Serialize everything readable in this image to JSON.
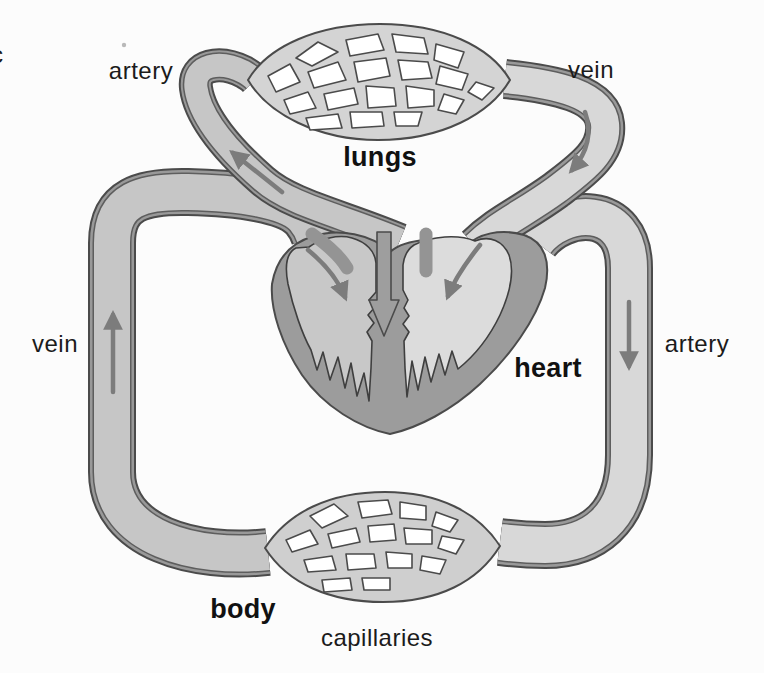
{
  "figure": {
    "panel_letter": "c",
    "labels": {
      "pulmonary_artery": "artery",
      "pulmonary_vein": "vein",
      "lungs": "lungs",
      "systemic_vein": "vein",
      "systemic_artery": "artery",
      "heart": "heart",
      "body": "body",
      "capillaries": "capillaries"
    },
    "arrows": [
      {
        "name": "pulmonary-artery-flow",
        "direction": "up-left toward lungs"
      },
      {
        "name": "pulmonary-vein-flow",
        "direction": "down toward heart"
      },
      {
        "name": "left-chamber-inflow",
        "direction": "down into heart"
      },
      {
        "name": "right-chamber-inflow",
        "direction": "down into heart"
      },
      {
        "name": "septum-flow",
        "direction": "down toward heart apex"
      },
      {
        "name": "systemic-vein-flow",
        "direction": "up toward heart"
      },
      {
        "name": "systemic-artery-flow",
        "direction": "down toward body"
      }
    ],
    "colors": {
      "background": "#fcfcfc",
      "tube_fill_deoxygenated": "#c6c6c6",
      "tube_fill_oxygenated": "#d8d8d8",
      "tube_wall": "#999999",
      "outline": "#4b4b4b",
      "heart_muscle": "#9c9c9c",
      "heart_left_chamber": "#c8c8c8",
      "heart_right_chamber": "#dcdcdc",
      "lungs_capillary_fill": "#d4d4d4",
      "body_capillary_fill": "#cfcfcf",
      "arrow": "#7c7c7c",
      "label_text": "#1b1b1b"
    }
  }
}
